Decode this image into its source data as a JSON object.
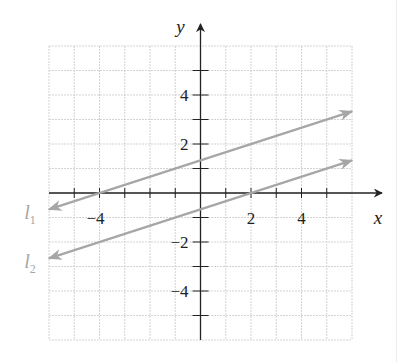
{
  "chart_data": {
    "type": "line",
    "title": "",
    "xlabel": "x",
    "ylabel": "y",
    "xlim": [
      -6,
      6
    ],
    "ylim": [
      -6,
      6
    ],
    "grid": true,
    "x_ticks": [
      -4,
      2,
      4
    ],
    "x_tick_labels": [
      "−4",
      "2",
      "4"
    ],
    "y_ticks": [
      4,
      2,
      -2,
      -4
    ],
    "y_tick_labels": [
      "4",
      "2",
      "−2",
      "−4"
    ],
    "series": [
      {
        "name": "l1",
        "label_main": "l",
        "label_sub": "1",
        "slope": 0.3333,
        "intercept": 1.3333,
        "x": [
          -6,
          6
        ],
        "y": [
          -0.67,
          3.33
        ],
        "passes_through": [
          [
            -4,
            0
          ],
          [
            0,
            1.33
          ]
        ]
      },
      {
        "name": "l2",
        "label_main": "l",
        "label_sub": "2",
        "slope": 0.3333,
        "intercept": -0.6667,
        "x": [
          -6,
          6
        ],
        "y": [
          -2.67,
          1.33
        ],
        "passes_through": [
          [
            2,
            0
          ],
          [
            0,
            -0.67
          ]
        ]
      }
    ],
    "colors": {
      "grid": "#c8c8c8",
      "axis": "#222222",
      "line": "#a6a6a6",
      "line_label": "#a6a6a6",
      "text": "#222222"
    }
  }
}
